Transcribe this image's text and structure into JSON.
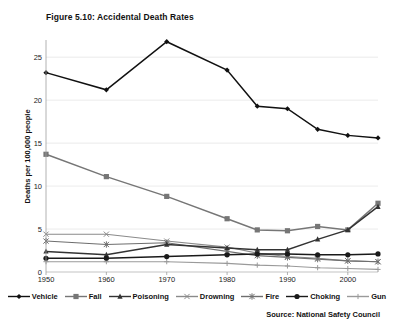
{
  "chart_data": {
    "type": "line",
    "title": "Figure 5.10: Accidental Death Rates",
    "xlabel": "",
    "ylabel": "Deaths per 100,000 people",
    "x": [
      1950,
      1960,
      1970,
      1980,
      1985,
      1990,
      1995,
      2000,
      2005
    ],
    "xlim": [
      1950,
      2005
    ],
    "ylim": [
      0,
      27
    ],
    "x_tick_labels": [
      "1950",
      "1960",
      "1970",
      "1980",
      "1990",
      "2000"
    ],
    "x_ticks": [
      1950,
      1960,
      1970,
      1980,
      1990,
      2000
    ],
    "y_ticks": [
      0,
      5,
      10,
      15,
      20,
      25
    ],
    "y_tick_labels": [
      "0",
      "5",
      "10",
      "15",
      "20",
      "25"
    ],
    "grid": "horizontal",
    "legend_position": "bottom",
    "source": "Source: National Safety Council",
    "series": [
      {
        "name": "Vehicle",
        "color": "#111111",
        "marker": "diamond",
        "values": [
          23.2,
          21.2,
          26.8,
          23.5,
          19.3,
          19.0,
          16.6,
          15.9,
          15.6
        ]
      },
      {
        "name": "Fall",
        "color": "#767676",
        "marker": "square",
        "values": [
          13.7,
          11.1,
          8.8,
          6.2,
          4.9,
          4.8,
          5.3,
          4.9,
          8.0
        ]
      },
      {
        "name": "Poisoning",
        "color": "#333333",
        "marker": "triangle",
        "values": [
          2.4,
          2.0,
          3.2,
          2.8,
          2.6,
          2.6,
          3.8,
          4.9,
          7.6
        ]
      },
      {
        "name": "Drowning",
        "color": "#8a8a8a",
        "marker": "x",
        "values": [
          4.4,
          4.4,
          3.6,
          2.9,
          2.2,
          1.8,
          1.6,
          1.3,
          1.2
        ]
      },
      {
        "name": "Fire",
        "color": "#6e6e6e",
        "marker": "star",
        "values": [
          3.6,
          3.2,
          3.4,
          2.4,
          1.9,
          1.7,
          1.5,
          1.3,
          1.2
        ]
      },
      {
        "name": "Choking",
        "color": "#1a1a1a",
        "marker": "circle",
        "values": [
          1.6,
          1.6,
          1.8,
          2.0,
          2.1,
          2.1,
          2.0,
          2.0,
          2.1
        ]
      },
      {
        "name": "Gun",
        "color": "#9a9a9a",
        "marker": "plus",
        "values": [
          1.2,
          1.2,
          1.2,
          1.0,
          0.8,
          0.7,
          0.5,
          0.4,
          0.3
        ]
      }
    ]
  },
  "chart": {
    "title": "Figure 5.10: Accidental Death Rates",
    "y_axis_title": "Deaths per 100,000 people",
    "source": "Source: National Safety Council"
  }
}
